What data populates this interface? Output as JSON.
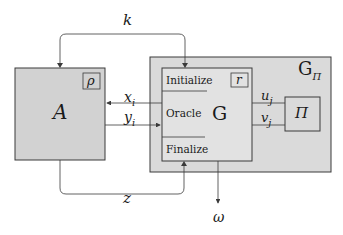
{
  "diagram": {
    "colors": {
      "box_fill": "#d2d2d2",
      "outer_fill": "#dadada",
      "inner_fill": "#e2e2e2",
      "stroke": "#3a3a3a",
      "background": "#ffffff"
    },
    "nodes": {
      "adversary": {
        "label": "A",
        "tag": "ρ"
      },
      "outer_game": {
        "label": "G",
        "subscript": "Π"
      },
      "game": {
        "label": "G",
        "tag": "r",
        "sections": [
          "Initialize",
          "Oracle",
          "Finalize"
        ]
      },
      "scheme": {
        "label": "Π"
      }
    },
    "edges": {
      "k": "k",
      "z": "z",
      "x_i": {
        "base": "x",
        "sub": "i"
      },
      "y_i": {
        "base": "y",
        "sub": "i"
      },
      "u_j": {
        "base": "u",
        "sub": "j"
      },
      "v_j": {
        "base": "v",
        "sub": "j"
      },
      "omega": "ω"
    }
  }
}
